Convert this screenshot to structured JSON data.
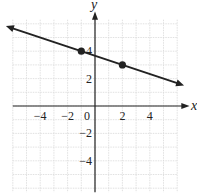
{
  "chart_data": {
    "type": "line",
    "title": "",
    "xlabel": "x",
    "ylabel": "y",
    "xlim": [
      -6,
      6
    ],
    "ylim": [
      -6.3,
      6.3
    ],
    "grid": true,
    "x_ticks": [
      -4,
      -2,
      0,
      2,
      4
    ],
    "x_tick_labels": [
      "−4",
      "−2",
      "0",
      "2",
      "4"
    ],
    "y_ticks": [
      4,
      2,
      -2,
      -4
    ],
    "y_tick_labels": [
      "4",
      "2",
      "−2",
      "−4"
    ],
    "line": {
      "equation": "y = -x/3 + 11/3",
      "slope": -0.3333,
      "intercept": 3.6667,
      "x_range": [
        -6.5,
        6.5
      ],
      "arrows": "both"
    },
    "points": [
      {
        "x": -1,
        "y": 4
      },
      {
        "x": 2,
        "y": 3
      }
    ],
    "colors": {
      "line": "#222222",
      "grid": "#d9d9d9",
      "axis": "#222222"
    }
  }
}
